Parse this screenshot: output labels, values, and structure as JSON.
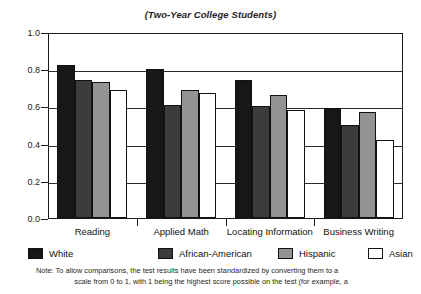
{
  "chart_data": {
    "type": "bar",
    "title": "(Two-Year College Students)",
    "xlabel": "",
    "ylabel": "",
    "ylim": [
      0,
      1
    ],
    "yticks": [
      "0.0",
      "0.2",
      "0.4",
      "0.6",
      "0.8",
      "1.0"
    ],
    "ytick_values": [
      0.0,
      0.2,
      0.4,
      0.6,
      0.8,
      1.0
    ],
    "grid": true,
    "legend_position": "bottom",
    "categories": [
      "Reading",
      "Applied Math",
      "Locating Information",
      "Business Writing"
    ],
    "series": [
      {
        "name": "White",
        "values": [
          0.82,
          0.8,
          0.74,
          0.59
        ],
        "color": "#171717"
      },
      {
        "name": "African-American",
        "values": [
          0.74,
          0.61,
          0.6,
          0.5
        ],
        "color": "#3c3c3c"
      },
      {
        "name": "Hispanic",
        "values": [
          0.73,
          0.69,
          0.66,
          0.57
        ],
        "color": "#939393"
      },
      {
        "name": "Asian",
        "values": [
          0.69,
          0.67,
          0.58,
          0.42
        ],
        "color": "#ffffff"
      }
    ]
  },
  "footnote": {
    "line1": "Note: To allow comparisons, the test results have been standardized by converting them to a",
    "line2": "scale from 0 to 1, with 1 being the highest score possible on the test (for example, a"
  }
}
